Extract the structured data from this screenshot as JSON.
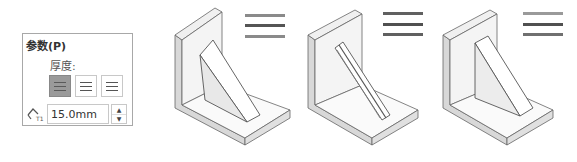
{
  "panel": {
    "title": "参数(P)",
    "thickness_label": "厚度:",
    "thickness_options": [
      {
        "name": "both-sides",
        "icon": "thickness-both-sides-icon",
        "selected": true
      },
      {
        "name": "side-one",
        "icon": "thickness-side-one-icon",
        "selected": false
      },
      {
        "name": "side-two",
        "icon": "thickness-side-two-icon",
        "selected": false
      }
    ],
    "thickness_value": "15.0mm",
    "thickness_icon": "rib-thickness-icon",
    "spin_up": "▲",
    "spin_down": "▼"
  },
  "illustrations": [
    {
      "name": "rib-both-sides",
      "legend_colors": [
        "#8a8a8a",
        "#555555",
        "#8a8a8a"
      ]
    },
    {
      "name": "rib-side-one",
      "legend_colors": [
        "#606060",
        "#505050",
        "#606060"
      ]
    },
    {
      "name": "rib-side-two",
      "legend_colors": [
        "#9a9a9a",
        "#505050",
        "#707070"
      ]
    }
  ]
}
